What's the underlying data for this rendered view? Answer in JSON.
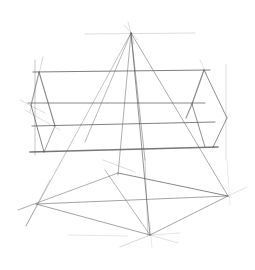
{
  "image": {
    "subject": "pencil perspective sketch of a rectangular box and pyramid construction lines",
    "background": "#ffffff",
    "stroke_color": "#555555"
  },
  "lines": [
    {
      "x1": 131,
      "y1": 33,
      "x2": 85,
      "y2": 142,
      "w": 0.7,
      "o": 0.6
    },
    {
      "x1": 131,
      "y1": 33,
      "x2": 150,
      "y2": 235,
      "w": 0.9,
      "o": 0.7
    },
    {
      "x1": 131,
      "y1": 33,
      "x2": 118,
      "y2": 175,
      "w": 0.8,
      "o": 0.6
    },
    {
      "x1": 131,
      "y1": 33,
      "x2": 145,
      "y2": 160,
      "w": 0.8,
      "o": 0.6
    },
    {
      "x1": 131,
      "y1": 33,
      "x2": 228,
      "y2": 196,
      "w": 0.8,
      "o": 0.6
    },
    {
      "x1": 131,
      "y1": 33,
      "x2": 26,
      "y2": 226,
      "w": 0.7,
      "o": 0.5
    },
    {
      "x1": 128,
      "y1": 22,
      "x2": 134,
      "y2": 44,
      "w": 0.5,
      "o": 0.4
    },
    {
      "x1": 124,
      "y1": 25,
      "x2": 138,
      "y2": 40,
      "w": 0.5,
      "o": 0.4
    },
    {
      "x1": 85,
      "y1": 34,
      "x2": 195,
      "y2": 33,
      "w": 0.6,
      "o": 0.35
    },
    {
      "x1": 33,
      "y1": 72,
      "x2": 210,
      "y2": 70,
      "w": 1.1,
      "o": 0.75
    },
    {
      "x1": 28,
      "y1": 103,
      "x2": 205,
      "y2": 103,
      "w": 1.0,
      "o": 0.7
    },
    {
      "x1": 32,
      "y1": 126,
      "x2": 215,
      "y2": 122,
      "w": 1.1,
      "o": 0.75
    },
    {
      "x1": 30,
      "y1": 152,
      "x2": 218,
      "y2": 147,
      "w": 1.5,
      "o": 0.8
    },
    {
      "x1": 35,
      "y1": 60,
      "x2": 35,
      "y2": 155,
      "w": 0.7,
      "o": 0.5
    },
    {
      "x1": 43,
      "y1": 57,
      "x2": 30,
      "y2": 112,
      "w": 0.6,
      "o": 0.4
    },
    {
      "x1": 39,
      "y1": 72,
      "x2": 55,
      "y2": 126,
      "w": 1.1,
      "o": 0.7
    },
    {
      "x1": 39,
      "y1": 72,
      "x2": 31,
      "y2": 105,
      "w": 0.9,
      "o": 0.6
    },
    {
      "x1": 31,
      "y1": 105,
      "x2": 44,
      "y2": 152,
      "w": 1.0,
      "o": 0.7
    },
    {
      "x1": 55,
      "y1": 126,
      "x2": 44,
      "y2": 152,
      "w": 0.9,
      "o": 0.6
    },
    {
      "x1": 20,
      "y1": 100,
      "x2": 45,
      "y2": 113,
      "w": 0.5,
      "o": 0.4
    },
    {
      "x1": 25,
      "y1": 110,
      "x2": 60,
      "y2": 130,
      "w": 0.5,
      "o": 0.35
    },
    {
      "x1": 204,
      "y1": 70,
      "x2": 192,
      "y2": 104,
      "w": 1.2,
      "o": 0.7
    },
    {
      "x1": 204,
      "y1": 70,
      "x2": 227,
      "y2": 118,
      "w": 1.0,
      "o": 0.65
    },
    {
      "x1": 192,
      "y1": 104,
      "x2": 205,
      "y2": 147,
      "w": 1.0,
      "o": 0.65
    },
    {
      "x1": 227,
      "y1": 118,
      "x2": 213,
      "y2": 147,
      "w": 1.0,
      "o": 0.65
    },
    {
      "x1": 192,
      "y1": 104,
      "x2": 186,
      "y2": 118,
      "w": 1.2,
      "o": 0.6
    },
    {
      "x1": 226,
      "y1": 64,
      "x2": 226,
      "y2": 160,
      "w": 0.6,
      "o": 0.35
    },
    {
      "x1": 200,
      "y1": 60,
      "x2": 207,
      "y2": 75,
      "w": 0.5,
      "o": 0.35
    },
    {
      "x1": 18,
      "y1": 210,
      "x2": 118,
      "y2": 173,
      "w": 0.8,
      "o": 0.6
    },
    {
      "x1": 36,
      "y1": 204,
      "x2": 228,
      "y2": 196,
      "w": 0.9,
      "o": 0.6
    },
    {
      "x1": 36,
      "y1": 204,
      "x2": 150,
      "y2": 235,
      "w": 0.9,
      "o": 0.6
    },
    {
      "x1": 118,
      "y1": 173,
      "x2": 228,
      "y2": 196,
      "w": 1.0,
      "o": 0.7
    },
    {
      "x1": 105,
      "y1": 170,
      "x2": 150,
      "y2": 235,
      "w": 0.8,
      "o": 0.55
    },
    {
      "x1": 150,
      "y1": 235,
      "x2": 228,
      "y2": 196,
      "w": 0.9,
      "o": 0.6
    },
    {
      "x1": 228,
      "y1": 196,
      "x2": 247,
      "y2": 187,
      "w": 0.5,
      "o": 0.35
    },
    {
      "x1": 120,
      "y1": 247,
      "x2": 150,
      "y2": 235,
      "w": 0.6,
      "o": 0.4
    },
    {
      "x1": 150,
      "y1": 235,
      "x2": 178,
      "y2": 243,
      "w": 0.5,
      "o": 0.35
    },
    {
      "x1": 150,
      "y1": 235,
      "x2": 180,
      "y2": 233,
      "w": 0.5,
      "o": 0.3
    },
    {
      "x1": 68,
      "y1": 235,
      "x2": 128,
      "y2": 236,
      "w": 0.5,
      "o": 0.3
    },
    {
      "x1": 150,
      "y1": 222,
      "x2": 152,
      "y2": 248,
      "w": 0.4,
      "o": 0.3
    },
    {
      "x1": 145,
      "y1": 160,
      "x2": 148,
      "y2": 236,
      "w": 0.6,
      "o": 0.45
    },
    {
      "x1": 103,
      "y1": 160,
      "x2": 135,
      "y2": 172,
      "w": 0.5,
      "o": 0.4
    },
    {
      "x1": 227,
      "y1": 160,
      "x2": 230,
      "y2": 205,
      "w": 0.4,
      "o": 0.3
    },
    {
      "x1": 26,
      "y1": 226,
      "x2": 50,
      "y2": 180,
      "w": 0.6,
      "o": 0.45
    }
  ]
}
